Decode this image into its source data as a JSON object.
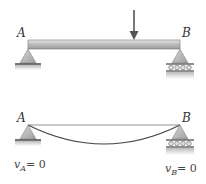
{
  "top_figure": {
    "label_left": "A",
    "label_right": "B",
    "load": "point-load-arrow"
  },
  "bottom_figure": {
    "label_left": "A",
    "label_right": "B",
    "condition_left": {
      "var": "v",
      "sub": "A",
      "rhs": "= 0"
    },
    "condition_right": {
      "var": "v",
      "sub": "B",
      "rhs": "= 0"
    }
  },
  "colors": {
    "beam_fill": "#c9c9c9",
    "support_fill": "#bdbdbd",
    "ground": "#555555",
    "line": "#444444"
  }
}
